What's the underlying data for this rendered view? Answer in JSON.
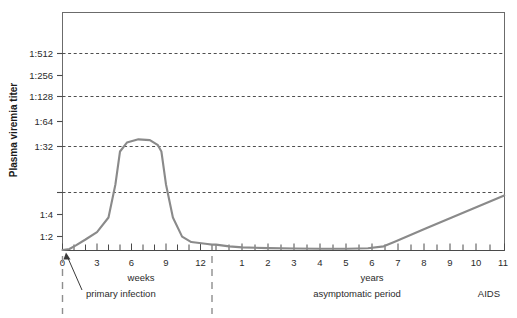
{
  "chart_data": {
    "type": "line",
    "title": "",
    "subtitle": "",
    "ylabel": "Plasma viremia titer",
    "xlabel": "",
    "grid": true,
    "legend": null,
    "series": [
      {
        "name": "Plasma viremia titer",
        "color": "#8a8a8a",
        "points": [
          {
            "x": 0.0,
            "y": 1.0
          },
          {
            "x": 0.6,
            "y": 1.1
          },
          {
            "x": 1.2,
            "y": 1.4
          },
          {
            "x": 2.0,
            "y": 2.0
          },
          {
            "x": 3.0,
            "y": 3.2
          },
          {
            "x": 4.0,
            "y": 8.0
          },
          {
            "x": 4.6,
            "y": 64.0
          },
          {
            "x": 5.0,
            "y": 512.0
          },
          {
            "x": 5.6,
            "y": 900.0
          },
          {
            "x": 6.6,
            "y": 1100.0
          },
          {
            "x": 7.6,
            "y": 1050.0
          },
          {
            "x": 8.3,
            "y": 760.0
          },
          {
            "x": 8.6,
            "y": 512.0
          },
          {
            "x": 9.0,
            "y": 64.0
          },
          {
            "x": 9.6,
            "y": 8.0
          },
          {
            "x": 10.4,
            "y": 2.4
          },
          {
            "x": 11.2,
            "y": 1.7
          },
          {
            "x": 12.6,
            "y": 1.5
          },
          {
            "x": 13.0,
            "y": 1.45
          }
        ],
        "points_years": [
          {
            "x": 0.0,
            "y": 1.45
          },
          {
            "x": 0.5,
            "y": 1.3
          },
          {
            "x": 1.0,
            "y": 1.22
          },
          {
            "x": 2.0,
            "y": 1.16
          },
          {
            "x": 3.0,
            "y": 1.13
          },
          {
            "x": 4.0,
            "y": 1.12
          },
          {
            "x": 5.0,
            "y": 1.12
          },
          {
            "x": 5.8,
            "y": 1.15
          },
          {
            "x": 6.4,
            "y": 1.3
          },
          {
            "x": 6.8,
            "y": 1.7
          },
          {
            "x": 8.0,
            "y": 4.0
          },
          {
            "x": 9.0,
            "y": 8.0
          },
          {
            "x": 10.0,
            "y": 16.0
          },
          {
            "x": 11.0,
            "y": 32.0
          }
        ]
      }
    ],
    "y_axis": {
      "scale": "log2",
      "ticks": [
        {
          "value": 2,
          "label": "1:2",
          "grid": false
        },
        {
          "value": 4,
          "label": "1:4",
          "grid": false
        },
        {
          "value": 8,
          "label": "",
          "grid": true
        },
        {
          "value": 32,
          "label": "1:32",
          "grid": true
        },
        {
          "value": 64,
          "label": "1:64",
          "grid": false
        },
        {
          "value": 128,
          "label": "1:128",
          "grid": true
        },
        {
          "value": 256,
          "label": "1:256",
          "grid": false
        },
        {
          "value": 512,
          "label": "1:512",
          "grid": true
        }
      ],
      "ylim": [
        1,
        1450
      ]
    },
    "x_axis": {
      "segments": [
        {
          "unit": "weeks",
          "tick_labels": [
            "0",
            "3",
            "6",
            "9",
            "12"
          ],
          "tick_values": [
            0,
            3,
            6,
            9,
            12
          ],
          "minor_interval": 1,
          "range": [
            0,
            13
          ]
        },
        {
          "unit": "years",
          "tick_labels": [
            "1",
            "2",
            "3",
            "4",
            "5",
            "6",
            "7",
            "8",
            "9",
            "10",
            "11"
          ],
          "tick_values": [
            1,
            2,
            3,
            4,
            5,
            6,
            7,
            8,
            9,
            10,
            11
          ],
          "minor_interval": 0.5,
          "range": [
            0,
            11
          ]
        }
      ]
    },
    "annotations": [
      {
        "name": "primary-infection",
        "text": "primary infection",
        "points_to_x": 0
      },
      {
        "name": "asymptomatic-period",
        "text": "asymptomatic period"
      },
      {
        "name": "aids-phase",
        "text": "AIDS"
      }
    ]
  },
  "axis": {
    "y_title": "Plasma viremia titer",
    "y_ticks": [
      "1:512",
      "1:256",
      "1:128",
      "1:64",
      "1:32",
      "",
      "1:4",
      "1:2"
    ],
    "weeks_unit": "weeks",
    "years_unit": "years",
    "weeks_ticks": [
      "0",
      "3",
      "6",
      "9",
      "12"
    ],
    "years_ticks": [
      "1",
      "2",
      "3",
      "4",
      "5",
      "6",
      "7",
      "8",
      "9",
      "10",
      "11"
    ]
  },
  "phases": {
    "primary_infection": "primary infection",
    "asymptomatic_period": "asymptomatic period",
    "aids": "AIDS"
  },
  "colors": {
    "curve": "#8a8a8a",
    "grid": "#3a3a3a",
    "axis": "#4a4a4a",
    "divider": "#8e8e8e",
    "text": "#2b2b2b",
    "background": "#ffffff"
  }
}
